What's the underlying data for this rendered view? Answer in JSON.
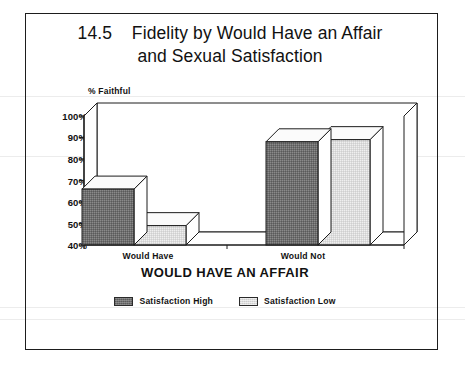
{
  "figure": {
    "title_line1": "14.5    Fidelity by Would Have an Affair",
    "title_line2": "and Sexual Satisfaction"
  },
  "chart_data": {
    "type": "bar",
    "style": "3d-clustered-bar",
    "title": "14.5  Fidelity by Would Have an Affair and Sexual Satisfaction",
    "figure_number": "14.5",
    "categories": [
      "Would Have",
      "Would Not"
    ],
    "series": [
      {
        "name": "Satisfaction High",
        "values": [
          66,
          88
        ],
        "color": "#6f6f6f"
      },
      {
        "name": "Satisfaction Low",
        "values": [
          49,
          89
        ],
        "color": "#dcdcdc"
      }
    ],
    "xlabel": "WOULD HAVE AN AFFAIR",
    "ylabel": "% Faithful",
    "ylim": [
      40,
      100
    ],
    "yticks": [
      "40%",
      "50%",
      "60%",
      "70%",
      "80%",
      "90%",
      "100%"
    ],
    "ytick_values": [
      40,
      50,
      60,
      70,
      80,
      90,
      100
    ],
    "grid": false,
    "legend_position": "bottom-center",
    "legend_entries": [
      "Satisfaction High",
      "Satisfaction Low"
    ],
    "value_unit": "percent"
  },
  "colors": {
    "axis": "#1d1d1d",
    "series_high": "#6f6f6f",
    "series_low": "#dcdcdc",
    "bar_top": "#fbfbfb",
    "background": "#ffffff",
    "text": "#111111"
  }
}
